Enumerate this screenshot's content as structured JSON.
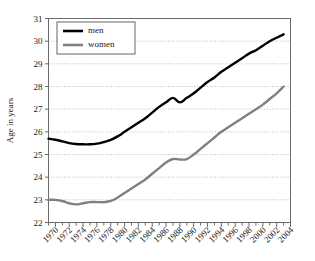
{
  "chart_data": {
    "type": "line",
    "title": "",
    "xlabel": "",
    "ylabel": "Age in years",
    "xlim": [
      1969,
      2004
    ],
    "ylim": [
      22,
      31
    ],
    "grid": true,
    "legend_position": "top-left-inside",
    "x_tick_labels": [
      "1970",
      "1972",
      "1974",
      "1976",
      "1978",
      "1980",
      "1982",
      "1984",
      "1986",
      "1988",
      "1990",
      "1992",
      "1994",
      "1996",
      "1998",
      "2000",
      "2002",
      "2004"
    ],
    "y_tick_labels": [
      "22",
      "23",
      "24",
      "25",
      "26",
      "27",
      "28",
      "29",
      "30",
      "31"
    ],
    "x": [
      1969,
      1970,
      1971,
      1972,
      1973,
      1974,
      1975,
      1976,
      1977,
      1978,
      1979,
      1980,
      1981,
      1982,
      1983,
      1984,
      1985,
      1986,
      1987,
      1988,
      1989,
      1990,
      1991,
      1992,
      1993,
      1994,
      1995,
      1996,
      1997,
      1998,
      1999,
      2000,
      2001,
      2002,
      2003
    ],
    "series": [
      {
        "name": "men",
        "color": "#000000",
        "values": [
          25.7,
          25.65,
          25.58,
          25.5,
          25.46,
          25.45,
          25.45,
          25.48,
          25.55,
          25.65,
          25.8,
          26.0,
          26.2,
          26.4,
          26.6,
          26.85,
          27.1,
          27.3,
          27.5,
          27.3,
          27.5,
          27.7,
          27.95,
          28.2,
          28.4,
          28.65,
          28.85,
          29.05,
          29.25,
          29.45,
          29.6,
          29.8,
          30.0,
          30.15,
          30.3
        ]
      },
      {
        "name": "women",
        "color": "#808080",
        "values": [
          23.0,
          23.0,
          22.95,
          22.85,
          22.8,
          22.85,
          22.9,
          22.9,
          22.9,
          22.95,
          23.1,
          23.3,
          23.5,
          23.7,
          23.9,
          24.15,
          24.4,
          24.65,
          24.8,
          24.78,
          24.8,
          25.0,
          25.25,
          25.5,
          25.75,
          26.0,
          26.2,
          26.4,
          26.6,
          26.8,
          27.0,
          27.2,
          27.45,
          27.7,
          28.0
        ]
      }
    ],
    "legend": [
      {
        "label": "men",
        "color": "#000000"
      },
      {
        "label": "women",
        "color": "#808080"
      }
    ],
    "colors": {
      "men_line": "#000000",
      "women_line": "#808080",
      "gridline": "#b4b4b4",
      "axis": "#6b6b6b",
      "background": "#ffffff"
    }
  }
}
